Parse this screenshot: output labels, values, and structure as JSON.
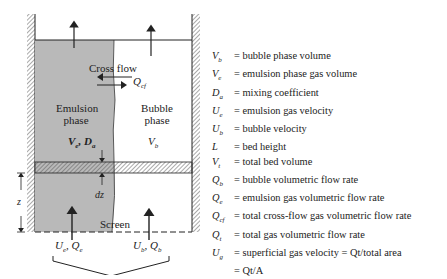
{
  "diagram": {
    "labels": {
      "cross_flow": "Cross flow",
      "q_cf": "Q",
      "q_cf_sub": "cf",
      "emulsion": "Emulsion",
      "emulsion_phase": "phase",
      "bubble": "Bubble",
      "bubble_phase": "phase",
      "ve_de": "V",
      "ve_sub": "e",
      "de": ", D",
      "de_sub": "a",
      "vb": "V",
      "vb_sub": "b",
      "dz": "dz",
      "z": "z",
      "screen": "Screen",
      "ue_qe": "U",
      "ue_sub": "e",
      "qe": ", Q",
      "qe_sub": "e",
      "ub_qb": "U",
      "ub_sub": "b",
      "qb": ", Q",
      "qb_sub": "b"
    },
    "colors": {
      "emulsion_fill": "#b9b9b9",
      "line": "#222222",
      "wall_hatch": "#555555"
    }
  },
  "legend": [
    {
      "symbol": "Vb",
      "text": "= bubble phase volume"
    },
    {
      "symbol": "Ve",
      "text": "= emulsion phase gas volume"
    },
    {
      "symbol": "Da",
      "text": "= mixing coefficient"
    },
    {
      "symbol": "Ue",
      "text": "= emulsion gas velocity"
    },
    {
      "symbol": "Ub",
      "text": "= bubble velocity"
    },
    {
      "symbol": "L",
      "text": "= bed height"
    },
    {
      "symbol": "Vt",
      "text": "= total bed volume"
    },
    {
      "symbol": "Qb",
      "text": "= bubble volumetric flow rate"
    },
    {
      "symbol": "Qe",
      "text": "= emulsion gas volumetric flow rate"
    },
    {
      "symbol": "Qcf",
      "text": "= total cross-flow gas volumetric flow rate"
    },
    {
      "symbol": "Qt",
      "text": "= total gas volumetric flow rate"
    },
    {
      "symbol": "Ug",
      "text": "= superficial gas velocity = Qt/total area"
    },
    {
      "symbol": "",
      "text": "= Qt/A"
    }
  ]
}
